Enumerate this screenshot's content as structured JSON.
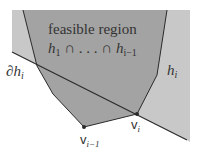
{
  "diagram": {
    "title_line1": "feasible region",
    "title_line2_a": "h",
    "title_line2_a_sub": "1",
    "title_line2_mid": " ∩ . . . ∩ ",
    "title_line2_b": "h",
    "title_line2_b_sub": "i−1",
    "boundary_label": "∂h",
    "boundary_label_sub": "i",
    "halfplane_label": "h",
    "halfplane_label_sub": "i",
    "vertex_prev_label": "v",
    "vertex_prev_label_sub": "i−1",
    "vertex_curr_label": "v",
    "vertex_curr_label_sub": "i"
  },
  "colors": {
    "halfplane_fill": "#c8c8c8",
    "feasible_fill": "#a3a3a3",
    "line": "#2b2b2b",
    "text": "#333333",
    "background": "#ffffff"
  }
}
